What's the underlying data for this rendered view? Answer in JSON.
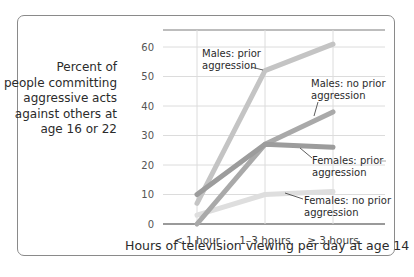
{
  "chart_data": {
    "type": "line",
    "title": "",
    "xlabel": "Hours of television viewing per day at age 14",
    "ylabel": "Percent of people committing aggressive acts against others at age 16 or 22",
    "categories": [
      "< 1 hour",
      "1–3 hours",
      "≥ 3 hours"
    ],
    "yticks": [
      0,
      10,
      20,
      30,
      40,
      50,
      60
    ],
    "ylim": [
      0,
      65
    ],
    "grid": true,
    "legend_position": "inline annotations",
    "series": [
      {
        "name": "Males: prior aggression",
        "values": [
          7,
          52,
          61
        ],
        "color": "#c4c4c4"
      },
      {
        "name": "Males: no prior aggression",
        "values": [
          0,
          27,
          38
        ],
        "color": "#a9a9a9"
      },
      {
        "name": "Females: prior aggression",
        "values": [
          10,
          27,
          26
        ],
        "color": "#9c9c9c"
      },
      {
        "name": "Females: no prior aggression",
        "values": [
          3,
          10,
          11
        ],
        "color": "#dedede"
      }
    ]
  },
  "labels": {
    "ylabel_lines": [
      "Percent of",
      "people committing",
      "aggressive acts",
      "against others at",
      "age 16 or 22"
    ],
    "xlabel": "Hours of television viewing per day at age 14",
    "xticks": [
      "< 1 hour",
      "1–3 hours",
      "≥ 3 hours"
    ],
    "yticks": [
      "0",
      "10",
      "20",
      "30",
      "40",
      "50",
      "60"
    ],
    "annotations": {
      "males_prior": [
        "Males: prior",
        "aggression"
      ],
      "males_no_prior": [
        "Males: no prior",
        "aggression"
      ],
      "females_prior": [
        "Females: prior",
        "aggression"
      ],
      "females_no_prior": [
        "Females: no prior",
        "aggression"
      ]
    }
  }
}
